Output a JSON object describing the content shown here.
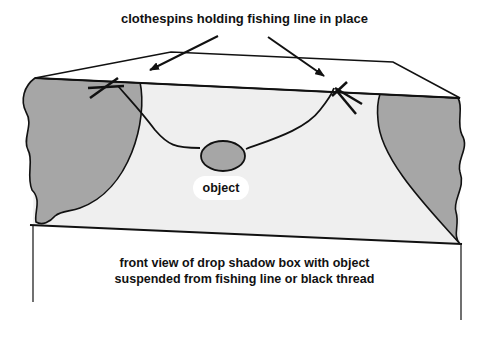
{
  "diagram": {
    "title": "clothespins holding fishing line in place",
    "object_label": "object",
    "caption_line1": "front view of drop shadow box with object",
    "caption_line2": "suspended from fishing line or black thread",
    "colors": {
      "line": "#111111",
      "box_interior": "#efefef",
      "shadow": "#a6a6a6",
      "object_fill": "#a6a6a6",
      "background": "#ffffff"
    },
    "elements": [
      "box top face",
      "box interior back panel",
      "left shadow",
      "right shadow",
      "fishing line",
      "left clothespin",
      "right clothespin",
      "suspended object",
      "two pointer arrows"
    ]
  }
}
